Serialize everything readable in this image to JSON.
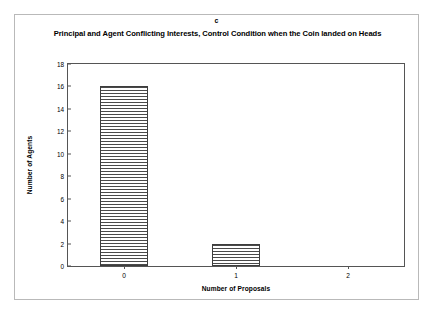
{
  "figure": {
    "panel_letter": "c",
    "background_color": "#ffffff",
    "frame_color": "#b9b9b9",
    "axis_color": "#555555",
    "bar_edge_color": "#3d3d3d",
    "bar_hatch": "horizontal-lines"
  },
  "chart_data": {
    "type": "bar",
    "title": "Principal and Agent Conflicting Interests, Control Condition when the Coin landed on Heads",
    "xlabel": "Number of Proposals",
    "ylabel": "Number of Agents",
    "categories": [
      "0",
      "1",
      "2"
    ],
    "values": [
      16,
      2,
      0
    ],
    "ylim": [
      0,
      18
    ],
    "ytick_labels": [
      "0",
      "2",
      "4",
      "6",
      "8",
      "10",
      "12",
      "14",
      "16",
      "18"
    ],
    "ytick_values": [
      0,
      2,
      4,
      6,
      8,
      10,
      12,
      14,
      16,
      18
    ],
    "grid": false,
    "legend": null,
    "series": [
      {
        "name": "Number of Agents",
        "values": [
          16,
          2,
          0
        ]
      }
    ]
  }
}
